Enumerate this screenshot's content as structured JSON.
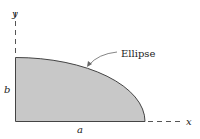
{
  "diagram": {
    "labels": {
      "y_axis": "y",
      "x_axis": "x",
      "height": "b",
      "width": "a",
      "curve": "Ellipse"
    },
    "colors": {
      "fill": "#c8c8c8",
      "stroke": "#444444",
      "axis": "#555555"
    }
  }
}
